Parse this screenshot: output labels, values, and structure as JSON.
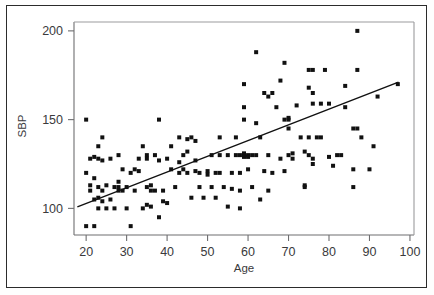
{
  "chart_data": {
    "type": "scatter",
    "title": "",
    "xlabel": "Age",
    "ylabel": "SBP",
    "xlim": [
      17,
      101
    ],
    "ylim": [
      85,
      205
    ],
    "xticks": [
      20,
      30,
      40,
      50,
      60,
      70,
      80,
      90,
      100
    ],
    "xtick_labels": [
      "20",
      "30",
      "40",
      "50",
      "60",
      "70",
      "80",
      "90",
      "100"
    ],
    "yticks": [
      100,
      150,
      200
    ],
    "ytick_labels": [
      "100",
      "150",
      "200"
    ],
    "grid": false,
    "legend": null,
    "marker": {
      "shape": "square",
      "color": "#111111",
      "size": 4
    },
    "series": [
      {
        "name": "Subjects",
        "points": [
          [
            20,
            150
          ],
          [
            20,
            120
          ],
          [
            20,
            90
          ],
          [
            21,
            128
          ],
          [
            21,
            113
          ],
          [
            21,
            110
          ],
          [
            22,
            105
          ],
          [
            22,
            90
          ],
          [
            22,
            129
          ],
          [
            22,
            117
          ],
          [
            23,
            106
          ],
          [
            23,
            112
          ],
          [
            23,
            100
          ],
          [
            23,
            135
          ],
          [
            23,
            128
          ],
          [
            24,
            140
          ],
          [
            24,
            127
          ],
          [
            24,
            110
          ],
          [
            24,
            104
          ],
          [
            25,
            113
          ],
          [
            25,
            100
          ],
          [
            26,
            105
          ],
          [
            26,
            128
          ],
          [
            27,
            100
          ],
          [
            27,
            112
          ],
          [
            28,
            130
          ],
          [
            28,
            115
          ],
          [
            28,
            110
          ],
          [
            28,
            112
          ],
          [
            29,
            110
          ],
          [
            29,
            122
          ],
          [
            30,
            100
          ],
          [
            30,
            112
          ],
          [
            31,
            120
          ],
          [
            31,
            90
          ],
          [
            32,
            122
          ],
          [
            32,
            110
          ],
          [
            33,
            128
          ],
          [
            33,
            121
          ],
          [
            34,
            135
          ],
          [
            34,
            100
          ],
          [
            35,
            102
          ],
          [
            35,
            112
          ],
          [
            35,
            130
          ],
          [
            35,
            128
          ],
          [
            36,
            110
          ],
          [
            36,
            113
          ],
          [
            36,
            101
          ],
          [
            37,
            130
          ],
          [
            37,
            110
          ],
          [
            38,
            150
          ],
          [
            38,
            95
          ],
          [
            38,
            127
          ],
          [
            39,
            110
          ],
          [
            39,
            104
          ],
          [
            40,
            103
          ],
          [
            40,
            128
          ],
          [
            41,
            135
          ],
          [
            41,
            122
          ],
          [
            42,
            112
          ],
          [
            43,
            140
          ],
          [
            43,
            126
          ],
          [
            43,
            120
          ],
          [
            44,
            130
          ],
          [
            44,
            122
          ],
          [
            45,
            132
          ],
          [
            45,
            120
          ],
          [
            45,
            139
          ],
          [
            46,
            106
          ],
          [
            46,
            140
          ],
          [
            47,
            138
          ],
          [
            47,
            127
          ],
          [
            47,
            121
          ],
          [
            48,
            120
          ],
          [
            48,
            112
          ],
          [
            49,
            106
          ],
          [
            50,
            121
          ],
          [
            50,
            119
          ],
          [
            51,
            130
          ],
          [
            51,
            112
          ],
          [
            52,
            120
          ],
          [
            52,
            106
          ],
          [
            53,
            140
          ],
          [
            53,
            130
          ],
          [
            53,
            120
          ],
          [
            54,
            112
          ],
          [
            55,
            101
          ],
          [
            55,
            130
          ],
          [
            56,
            120
          ],
          [
            56,
            111
          ],
          [
            57,
            140
          ],
          [
            57,
            130
          ],
          [
            58,
            130
          ],
          [
            58,
            120
          ],
          [
            58,
            100
          ],
          [
            58,
            110
          ],
          [
            59,
            170
          ],
          [
            59,
            157
          ],
          [
            59,
            150
          ],
          [
            59,
            130
          ],
          [
            59,
            129
          ],
          [
            59,
            131
          ],
          [
            60,
            130
          ],
          [
            60,
            122
          ],
          [
            60,
            129
          ],
          [
            61,
            130
          ],
          [
            61,
            112
          ],
          [
            62,
            188
          ],
          [
            62,
            148
          ],
          [
            62,
            130
          ],
          [
            63,
            105
          ],
          [
            63,
            140
          ],
          [
            64,
            165
          ],
          [
            64,
            121
          ],
          [
            65,
            163
          ],
          [
            65,
            130
          ],
          [
            65,
            110
          ],
          [
            66,
            165
          ],
          [
            66,
            120
          ],
          [
            67,
            157
          ],
          [
            68,
            172
          ],
          [
            68,
            128
          ],
          [
            69,
            182
          ],
          [
            69,
            150
          ],
          [
            69,
            121
          ],
          [
            70,
            150
          ],
          [
            70,
            151
          ],
          [
            70,
            145
          ],
          [
            70,
            130
          ],
          [
            71,
            128
          ],
          [
            71,
            131
          ],
          [
            72,
            158
          ],
          [
            73,
            140
          ],
          [
            74,
            132
          ],
          [
            74,
            112
          ],
          [
            74,
            113
          ],
          [
            75,
            178
          ],
          [
            75,
            168
          ],
          [
            75,
            140
          ],
          [
            75,
            130
          ],
          [
            76,
            178
          ],
          [
            76,
            165
          ],
          [
            76,
            159
          ],
          [
            76,
            128
          ],
          [
            76,
            125
          ],
          [
            77,
            140
          ],
          [
            78,
            159
          ],
          [
            78,
            140
          ],
          [
            79,
            178
          ],
          [
            80,
            159
          ],
          [
            80,
            129
          ],
          [
            81,
            124
          ],
          [
            82,
            130
          ],
          [
            83,
            130
          ],
          [
            84,
            169
          ],
          [
            84,
            157
          ],
          [
            86,
            145
          ],
          [
            86,
            122
          ],
          [
            86,
            112
          ],
          [
            87,
            200
          ],
          [
            87,
            178
          ],
          [
            87,
            145
          ],
          [
            88,
            140
          ],
          [
            90,
            122
          ],
          [
            91,
            135
          ],
          [
            92,
            163
          ],
          [
            97,
            170
          ]
        ]
      }
    ],
    "fit_line": {
      "name": "Least-squares regression",
      "x_start": 18,
      "y_start": 101,
      "x_end": 97,
      "y_end": 171,
      "slope": 0.886,
      "intercept": 85.05,
      "color": "#111111"
    }
  }
}
